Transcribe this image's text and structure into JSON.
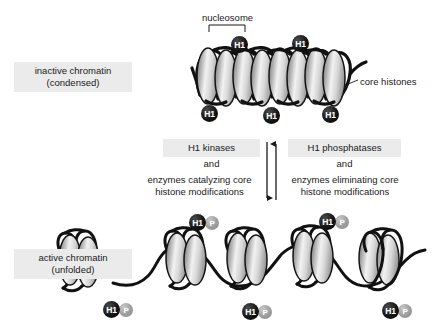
{
  "figure": {
    "background_color": "#ffffff",
    "highlight_color": "#ebebeb",
    "text_color": "#1a1a1a",
    "h1_badge_color": "#000000",
    "p_badge_color": "#9d9d9d"
  },
  "labels": {
    "inactive_line1": "inactive chromatin",
    "inactive_line2": "(condensed)",
    "active_line1": "active chromatin",
    "active_line2": "(unfolded)",
    "nucleosome": "nucleosome",
    "core_histones": "core histones"
  },
  "middle": {
    "left": {
      "heading": "H1 kinases",
      "conjunction": "and",
      "description_line1": "enzymes catalyzing core",
      "description_line2": "histone modifications"
    },
    "right": {
      "heading": "H1 phosphatases",
      "conjunction": "and",
      "description_line1": "enzymes eliminating core",
      "description_line2": "histone modifications"
    }
  },
  "badges": {
    "h1_label": "H1",
    "p_label": "P",
    "condensed_top": [
      {
        "x": 231,
        "y": 36
      },
      {
        "x": 292,
        "y": 35
      }
    ],
    "condensed_bottom": [
      {
        "x": 201,
        "y": 105
      },
      {
        "x": 263,
        "y": 107
      },
      {
        "x": 322,
        "y": 106
      }
    ],
    "active_top": [
      {
        "h1_x": 189,
        "h1_y": 214,
        "p_x": 205,
        "p_y": 216
      },
      {
        "h1_x": 319,
        "h1_y": 213,
        "p_x": 335,
        "p_y": 215
      }
    ],
    "active_bottom": [
      {
        "h1_x": 103,
        "h1_y": 301,
        "p_x": 119,
        "p_y": 303
      },
      {
        "h1_x": 242,
        "h1_y": 303,
        "p_x": 258,
        "p_y": 305
      },
      {
        "h1_x": 382,
        "h1_y": 302,
        "p_x": 398,
        "p_y": 304
      }
    ]
  },
  "arrows": {
    "down_arrow_name": "condensation-to-active-arrow",
    "up_arrow_name": "active-to-condensation-arrow"
  }
}
